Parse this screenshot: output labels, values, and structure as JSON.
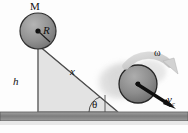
{
  "figure": {
    "background_color": "#fdfdfd",
    "labels": {
      "mass": "M",
      "radius": "R",
      "height": "h",
      "distance": "x",
      "angle": "θ",
      "angular_velocity": "ω",
      "velocity_symbol": "v",
      "velocity_subscript": "c"
    },
    "colors": {
      "disk_fill": "#8f8f8f",
      "disk_edge": "#3a3a3a",
      "incline_fill": "#e2e2e2",
      "incline_edge": "#9a9a9a",
      "ground_fill": "#8c8c8c",
      "ground_edge": "#5a5a5a",
      "arrow_fill": "#d0d0d0",
      "line_color": "#1a1a1a",
      "blur_color": "#cfcfcf"
    },
    "geometry": {
      "top_disk": {
        "cx": 38,
        "cy": 31,
        "r": 18
      },
      "bottom_disk": {
        "cx": 138,
        "cy": 84,
        "r": 19
      },
      "incline_apex": {
        "x": 38,
        "y": 45
      },
      "incline_base_right": {
        "x": 118,
        "y": 112
      },
      "ground_y": 112,
      "angle_degrees": 40
    }
  }
}
